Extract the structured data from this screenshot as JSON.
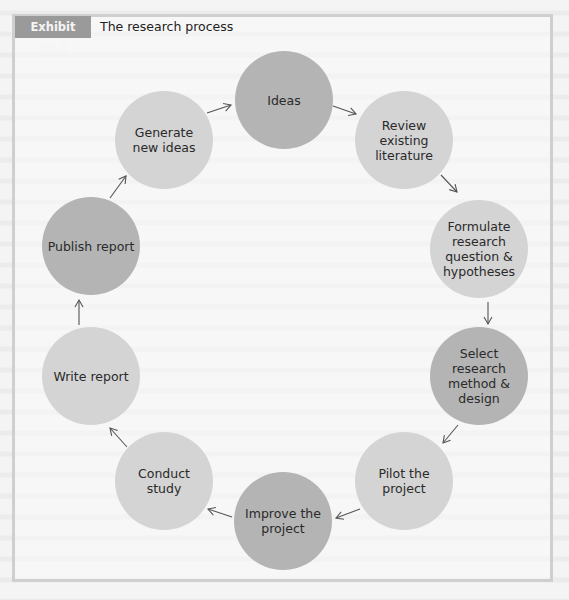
{
  "exhibit": {
    "label": "Exhibit 13.3",
    "title": "The research process"
  },
  "colors": {
    "dark_node": "#b4b4b4",
    "light_node": "#d4d4d4",
    "label_bg": "#9a9a9a",
    "frame": "#cfcfcf"
  },
  "nodes": [
    {
      "id": "ideas",
      "lines": [
        "Ideas"
      ],
      "cx": 284,
      "cy": 100,
      "shade": "dark"
    },
    {
      "id": "review-literature",
      "lines": [
        "Review",
        "existing",
        "literature"
      ],
      "cx": 404,
      "cy": 140,
      "shade": "light"
    },
    {
      "id": "formulate-question",
      "lines": [
        "Formulate",
        "research",
        "question &",
        "hypotheses"
      ],
      "cx": 479,
      "cy": 249,
      "shade": "light"
    },
    {
      "id": "select-method",
      "lines": [
        "Select",
        "research",
        "method &",
        "design"
      ],
      "cx": 479,
      "cy": 376,
      "shade": "dark"
    },
    {
      "id": "pilot-project",
      "lines": [
        "Pilot the",
        "project"
      ],
      "cx": 404,
      "cy": 481,
      "shade": "light"
    },
    {
      "id": "improve-project",
      "lines": [
        "Improve the",
        "project"
      ],
      "cx": 283,
      "cy": 521,
      "shade": "dark"
    },
    {
      "id": "conduct-study",
      "lines": [
        "Conduct",
        "study"
      ],
      "cx": 164,
      "cy": 481,
      "shade": "light"
    },
    {
      "id": "write-report",
      "lines": [
        "Write report"
      ],
      "cx": 91,
      "cy": 376,
      "shade": "light"
    },
    {
      "id": "publish-report",
      "lines": [
        "Publish report"
      ],
      "cx": 91,
      "cy": 246,
      "shade": "dark"
    },
    {
      "id": "generate-ideas",
      "lines": [
        "Generate",
        "new ideas"
      ],
      "cx": 164,
      "cy": 140,
      "shade": "light"
    }
  ],
  "arrows": [
    {
      "from": "ideas",
      "to": "review-literature",
      "x1": 333,
      "y1": 106,
      "x2": 356,
      "y2": 114
    },
    {
      "from": "review-literature",
      "to": "formulate-question",
      "x1": 441,
      "y1": 175,
      "x2": 457,
      "y2": 192
    },
    {
      "from": "formulate-question",
      "to": "select-method",
      "x1": 488,
      "y1": 302,
      "x2": 488,
      "y2": 324
    },
    {
      "from": "select-method",
      "to": "pilot-project",
      "x1": 458,
      "y1": 425,
      "x2": 443,
      "y2": 443
    },
    {
      "from": "pilot-project",
      "to": "improve-project",
      "x1": 360,
      "y1": 509,
      "x2": 336,
      "y2": 518
    },
    {
      "from": "improve-project",
      "to": "conduct-study",
      "x1": 232,
      "y1": 517,
      "x2": 208,
      "y2": 509
    },
    {
      "from": "conduct-study",
      "to": "write-report",
      "x1": 127,
      "y1": 447,
      "x2": 110,
      "y2": 428
    },
    {
      "from": "write-report",
      "to": "publish-report",
      "x1": 79,
      "y1": 325,
      "x2": 79,
      "y2": 300
    },
    {
      "from": "publish-report",
      "to": "generate-ideas",
      "x1": 110,
      "y1": 198,
      "x2": 126,
      "y2": 176
    },
    {
      "from": "generate-ideas",
      "to": "ideas",
      "x1": 207,
      "y1": 113,
      "x2": 231,
      "y2": 105
    }
  ],
  "radius": 49
}
